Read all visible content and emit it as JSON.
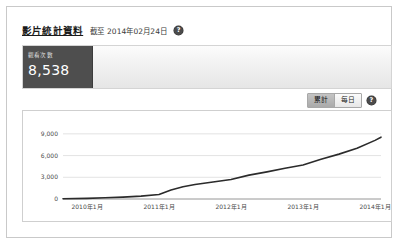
{
  "header": {
    "title": "影片統計資料",
    "as_of": "截至 2014年02月24日",
    "help_icon": "help-question-icon",
    "help_glyph": "?"
  },
  "summary": {
    "metric_label": "觀看次數",
    "metric_value": "8,538"
  },
  "controls": {
    "cumulative_label": "累計",
    "daily_label": "每日",
    "selected": "累計",
    "help_icon": "help-question-icon",
    "help_glyph": "?"
  },
  "colors": {
    "line": "#2b2b2b",
    "grid": "#dcdcdc",
    "card_dark": "#4e4e4e",
    "panel_border": "#cfcfcf",
    "frame_border": "#c9c9c9"
  },
  "chart_data": {
    "type": "line",
    "title": "",
    "xlabel": "",
    "ylabel": "",
    "grid": true,
    "legend": false,
    "ylim": [
      0,
      10500
    ],
    "yticks": [
      0,
      3000,
      6000,
      9000
    ],
    "ytick_labels": [
      "0",
      "3,000",
      "6,000",
      "9,000"
    ],
    "xtick_labels": [
      "2010年1月",
      "2011年1月",
      "2012年1月",
      "2013年1月",
      "2014年1月"
    ],
    "xlim": [
      "2009-09",
      "2014-02"
    ],
    "series": [
      {
        "name": "累計觀看次數",
        "x": [
          "2009-09",
          "2010-01",
          "2010-04",
          "2010-07",
          "2010-10",
          "2011-01",
          "2011-03",
          "2011-05",
          "2011-07",
          "2011-10",
          "2012-01",
          "2012-04",
          "2012-07",
          "2012-10",
          "2013-01",
          "2013-04",
          "2013-07",
          "2013-10",
          "2014-01",
          "2014-02"
        ],
        "values": [
          30,
          90,
          170,
          260,
          400,
          620,
          1250,
          1700,
          2000,
          2350,
          2700,
          3300,
          3750,
          4250,
          4700,
          5500,
          6200,
          7000,
          8100,
          8538
        ]
      }
    ]
  }
}
